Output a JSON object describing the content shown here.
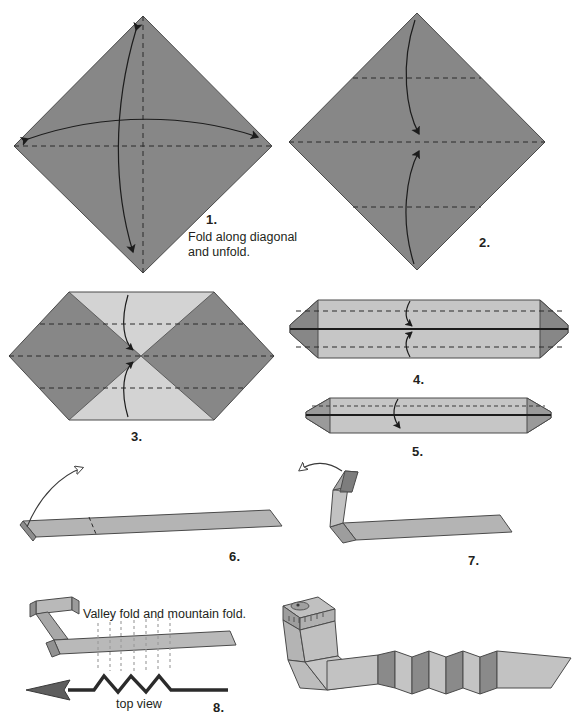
{
  "document": {
    "title": "Origami Snake Folding Instructions",
    "type": "instruction-diagram",
    "step_count": 8
  },
  "palette": {
    "paper_dark": "#878787",
    "paper_dark_shade": "#7a7a7a",
    "paper_light": "#d3d3d3",
    "paper_light_shade": "#c3c3c3",
    "paper_mid": "#adadad",
    "outline": "#3a3a3a",
    "crease": "#2b2b2b",
    "ink": "#231f20",
    "background": "#ffffff"
  },
  "steps": [
    {
      "number": "1.",
      "caption_line1": "Fold along diagonal",
      "caption_line2": "and unfold.",
      "shape": "square rotated 45 degrees (diamond)",
      "creases": [
        "vertical diagonal",
        "horizontal diagonal"
      ],
      "arrows": [
        "vertical double-headed fold-and-unfold arc",
        "horizontal double-headed fold-and-unfold arc"
      ]
    },
    {
      "number": "2.",
      "caption_line1": "",
      "caption_line2": "",
      "shape": "diamond with horizontal quarter creases",
      "creases": [
        "upper quarter horizontal",
        "center horizontal",
        "lower quarter horizontal"
      ],
      "arrows": [
        "top point folding down to center",
        "bottom point folding up to center"
      ]
    },
    {
      "number": "3.",
      "caption_line1": "",
      "caption_line2": "",
      "shape": "hexagon with light top and bottom triangles",
      "creases": [
        "upper horizontal",
        "center horizontal",
        "lower horizontal"
      ],
      "arrows": [
        "top edge folding down to center",
        "bottom edge folding up to center"
      ]
    },
    {
      "number": "4.",
      "caption_line1": "",
      "caption_line2": "",
      "shape": "long flattened hexagonal band with dark end triangles",
      "creases": [
        "upper horizontal",
        "center horizontal",
        "lower horizontal"
      ],
      "arrows": [
        "top half folding down",
        "bottom half folding up"
      ]
    },
    {
      "number": "5.",
      "caption_line1": "",
      "caption_line2": "",
      "shape": "narrow long strip with dark ends",
      "creases": [
        "center horizontal"
      ],
      "arrows": [
        "fold in half downward"
      ]
    },
    {
      "number": "6.",
      "caption_line1": "",
      "caption_line2": "",
      "shape": "thin flat strip seen in perspective",
      "creases": [
        "short diagonal crease near left end"
      ],
      "arrows": [
        "left end lifting upward"
      ]
    },
    {
      "number": "7.",
      "caption_line1": "",
      "caption_line2": "",
      "shape": "strip with folded up left end forming head blank",
      "creases": [
        "head fold creases"
      ],
      "arrows": [
        "fold head piece back to the left"
      ]
    },
    {
      "number": "8.",
      "caption_line1": "Valley fold and mountain fold.",
      "caption_line2": "top view",
      "shape": "strip with zigzag pleat markings plus finished snake",
      "creases": [
        "seven parallel vertical pleat lines"
      ],
      "arrows": []
    }
  ],
  "labels": {
    "step1_number": "1.",
    "step1_text_line1": "Fold along diagonal",
    "step1_text_line2": "and unfold.",
    "step2_number": "2.",
    "step3_number": "3.",
    "step4_number": "4.",
    "step5_number": "5.",
    "step6_number": "6.",
    "step7_number": "7.",
    "step8_number": "8.",
    "step8_instruction": "Valley fold and mountain fold.",
    "step8_topview": "top view"
  }
}
